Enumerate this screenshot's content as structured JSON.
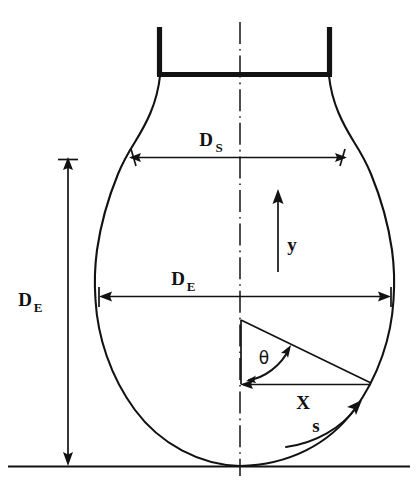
{
  "figure": {
    "background_color": "#ffffff",
    "ink_color": "#121212",
    "width": 418,
    "height": 502
  },
  "labels": {
    "ds_symbol": "D",
    "ds_subscript": "S",
    "de_horizontal_symbol": "D",
    "de_horizontal_subscript": "E",
    "de_vertical_symbol": "D",
    "de_vertical_subscript": "E",
    "y_label": "y",
    "x_label": "X",
    "s_label": "s",
    "theta_label": "θ"
  },
  "annotations": {
    "ds_description": "stem / neck diameter dimension",
    "de_horizontal_description": "maximum equatorial diameter dimension",
    "de_vertical_description": "vertical height dimension from equator to base",
    "y_description": "vertical coordinate arrow pointing up",
    "x_description": "horizontal coordinate from axis to surface",
    "s_description": "arc length coordinate along the surface",
    "theta_description": "angle measured from the vertical axis"
  },
  "geometry": {
    "center_x": 240,
    "ground_y": 466,
    "neck_top_y": 26,
    "neck_bar_y": 74,
    "neck_left_x": 158,
    "neck_right_x": 330,
    "ds_line_y": 157,
    "ds_left_x": 128,
    "ds_right_x": 348,
    "de_line_y": 296,
    "de_left_x": 100,
    "de_right_x": 390,
    "bulb_radius": 145,
    "triangle_apex_y": 320,
    "triangle_base_y": 384
  }
}
